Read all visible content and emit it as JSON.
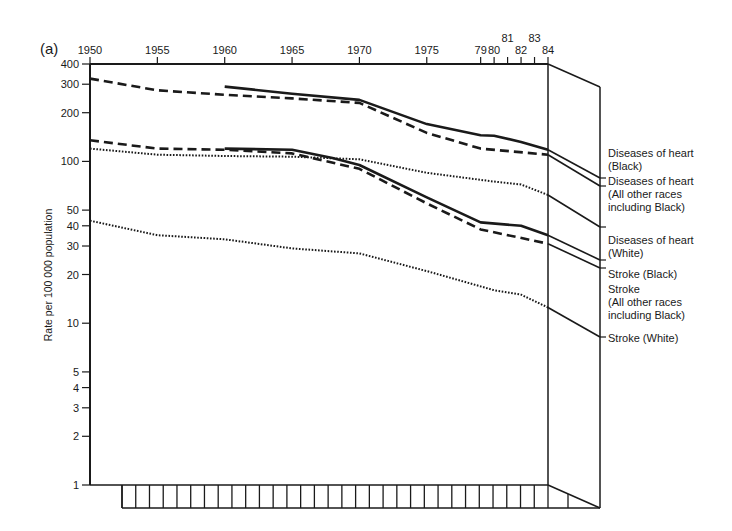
{
  "chart_data": {
    "type": "line",
    "panel_label": "(a)",
    "title": "",
    "xlabel": "",
    "ylabel": "Rate per 100 000 population",
    "yscale": "log",
    "ylim": [
      1,
      400
    ],
    "xlim": [
      1950,
      1984
    ],
    "grid": false,
    "legend_position": "right (labels attached to line ends on 3D side face)",
    "x_ticks": [
      {
        "year": 1950,
        "label": "1950"
      },
      {
        "year": 1955,
        "label": "1955"
      },
      {
        "year": 1960,
        "label": "1960"
      },
      {
        "year": 1965,
        "label": "1965"
      },
      {
        "year": 1970,
        "label": "1970"
      },
      {
        "year": 1975,
        "label": "1975"
      },
      {
        "year": 1979,
        "label": "79"
      },
      {
        "year": 1980,
        "label": "80"
      },
      {
        "year": 1981,
        "label": "81"
      },
      {
        "year": 1982,
        "label": "82"
      },
      {
        "year": 1983,
        "label": "83"
      },
      {
        "year": 1984,
        "label": "84"
      }
    ],
    "y_ticks": [
      {
        "value": 400,
        "label": "400"
      },
      {
        "value": 300,
        "label": "300"
      },
      {
        "value": 200,
        "label": "200"
      },
      {
        "value": 100,
        "label": "100"
      },
      {
        "value": 50,
        "label": "50"
      },
      {
        "value": 40,
        "label": "40"
      },
      {
        "value": 30,
        "label": "30"
      },
      {
        "value": 20,
        "label": "20"
      },
      {
        "value": 10,
        "label": "10"
      },
      {
        "value": 5,
        "label": "5"
      },
      {
        "value": 4,
        "label": "4"
      },
      {
        "value": 3,
        "label": "3"
      },
      {
        "value": 2,
        "label": "2"
      },
      {
        "value": 1,
        "label": "1"
      }
    ],
    "series": [
      {
        "name": "Diseases of heart (Black)",
        "label_lines": [
          "Diseases of heart",
          "(Black)"
        ],
        "style": "solid",
        "x": [
          1960,
          1965,
          1970,
          1975,
          1979,
          1980,
          1982,
          1984
        ],
        "values": [
          290,
          262,
          240,
          170,
          145,
          144,
          132,
          118
        ]
      },
      {
        "name": "Diseases of heart (All other races including Black)",
        "label_lines": [
          "Diseases of heart",
          "(All other races",
          "including Black)"
        ],
        "style": "dashed",
        "x": [
          1950,
          1955,
          1960,
          1965,
          1970,
          1975,
          1979,
          1984
        ],
        "values": [
          325,
          275,
          258,
          245,
          230,
          150,
          120,
          110
        ]
      },
      {
        "name": "Diseases of heart (White)",
        "label_lines": [
          "Diseases of heart",
          "(White)"
        ],
        "style": "dotted",
        "x": [
          1950,
          1955,
          1960,
          1965,
          1970,
          1975,
          1980,
          1982,
          1984
        ],
        "values": [
          120,
          110,
          108,
          107,
          103,
          85,
          75,
          72,
          62
        ]
      },
      {
        "name": "Stroke (Black)",
        "label_lines": [
          "Stroke (Black)"
        ],
        "style": "solid",
        "x": [
          1960,
          1965,
          1968,
          1970,
          1975,
          1979,
          1982,
          1984
        ],
        "values": [
          120,
          118,
          105,
          95,
          60,
          42,
          40,
          35
        ]
      },
      {
        "name": "Stroke (All other races including Black)",
        "label_lines": [
          "Stroke",
          "(All other races",
          "including Black)"
        ],
        "style": "dashed",
        "x": [
          1950,
          1955,
          1960,
          1965,
          1970,
          1975,
          1979,
          1984
        ],
        "values": [
          135,
          120,
          118,
          112,
          90,
          55,
          38,
          31
        ]
      },
      {
        "name": "Stroke (White)",
        "label_lines": [
          "Stroke (White)"
        ],
        "style": "dotted",
        "x": [
          1950,
          1955,
          1960,
          1965,
          1970,
          1975,
          1980,
          1982,
          1984
        ],
        "values": [
          43,
          35,
          33,
          29,
          27,
          21,
          16,
          15,
          12.5
        ]
      }
    ]
  },
  "colors": {
    "ink": "#1a1a1a",
    "background": "#ffffff"
  }
}
